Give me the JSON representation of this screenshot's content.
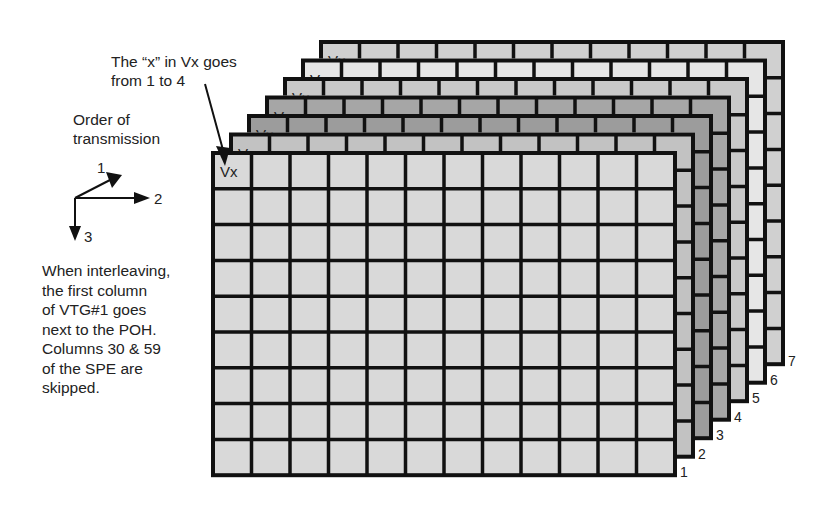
{
  "annotations": {
    "vx_note": "The “x” in Vx goes\nfrom 1 to 4",
    "order_title": "Order of\ntransmission",
    "interleave_note": "When interleaving,\nthe first column\nof VTG#1 goes\nnext to the POH.\nColumns 30 & 59\nof the SPE are\nskipped."
  },
  "order_axes": [
    {
      "label": "1",
      "direction": "diagonal-up-right"
    },
    {
      "label": "2",
      "direction": "right"
    },
    {
      "label": "3",
      "direction": "down"
    }
  ],
  "grid": {
    "columns": 12,
    "rows": 9,
    "corner_cell_label": "Vx",
    "front_origin": {
      "x": 213,
      "y": 153
    },
    "cell_width": 38.5,
    "cell_height": 35.8,
    "layer_offset": {
      "dx": 18,
      "dy": -18.5
    },
    "line_color": "#111111"
  },
  "layers": [
    {
      "id": 1,
      "label": "1",
      "fill": "#d9d9d9"
    },
    {
      "id": 2,
      "label": "2",
      "fill": "#c2c2c2"
    },
    {
      "id": 3,
      "label": "3",
      "fill": "#9c9c9c"
    },
    {
      "id": 4,
      "label": "4",
      "fill": "#a6a6a6"
    },
    {
      "id": 5,
      "label": "5",
      "fill": "#c9c9c9"
    },
    {
      "id": 6,
      "label": "6",
      "fill": "#e6e6e6"
    },
    {
      "id": 7,
      "label": "7",
      "fill": "#d0d0d0"
    }
  ]
}
